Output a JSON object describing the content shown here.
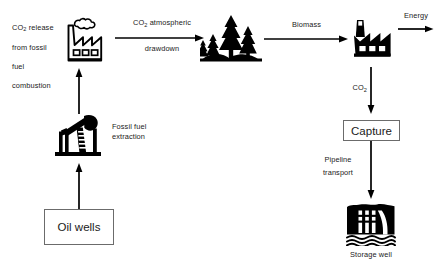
{
  "diagram": {
    "stroke_color": "#000000",
    "box_border_color": "#6b6b6b",
    "background": "#ffffff"
  },
  "nodes": {
    "fossil_plant": {
      "icon": "factory-smokestack-icon",
      "label": "CO2 release\nfrom fossil\nfuel\ncombustion"
    },
    "forest": {
      "icon": "forest-trees-icon"
    },
    "biomass_plant": {
      "icon": "factory-icon"
    },
    "pumpjack": {
      "icon": "oil-pumpjack-icon",
      "label": "Fossil fuel\nextraction"
    },
    "oil_wells": {
      "label": "Oil wells"
    },
    "capture": {
      "label": "Capture"
    },
    "storage_well": {
      "icon": "dam-water-icon",
      "label": "Storage well"
    }
  },
  "edges": {
    "drawdown": {
      "label_top": "CO2 atmospheric",
      "label_bottom": "drawdown"
    },
    "biomass": {
      "label": "Biomass"
    },
    "energy": {
      "label": "Energy"
    },
    "co2_to_capture": {
      "label": "CO2"
    },
    "pipeline": {
      "label_top": "Pipeline",
      "label_bottom": "transport"
    },
    "pumpjack_to_plant": {
      "label": ""
    },
    "wells_to_pumpjack": {
      "label": ""
    }
  },
  "sub_labels": {
    "co2_release_line1_pre": "CO",
    "co2_release_line1_sub": "2",
    "co2_release_line1_post": " release",
    "co2_release_line2": "from fossil",
    "co2_release_line3": "fuel",
    "co2_release_line4": "combustion",
    "drawdown_pre": "CO",
    "drawdown_sub": "2",
    "drawdown_post": " atmospheric",
    "drawdown_line2": "drawdown",
    "co2_arrow_pre": "CO",
    "co2_arrow_sub": "2"
  }
}
